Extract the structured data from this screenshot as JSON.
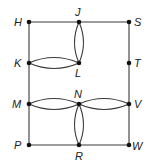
{
  "diagram": {
    "type": "graph",
    "vertices": [
      {
        "id": "H",
        "label": "H",
        "x": 29,
        "y": 22
      },
      {
        "id": "J",
        "label": "J",
        "x": 79,
        "y": 22
      },
      {
        "id": "S",
        "label": "S",
        "x": 129,
        "y": 22
      },
      {
        "id": "K",
        "label": "K",
        "x": 29,
        "y": 63
      },
      {
        "id": "L",
        "label": "L",
        "x": 79,
        "y": 63
      },
      {
        "id": "T",
        "label": "T",
        "x": 129,
        "y": 63
      },
      {
        "id": "M",
        "label": "M",
        "x": 29,
        "y": 104
      },
      {
        "id": "N",
        "label": "N",
        "x": 79,
        "y": 104
      },
      {
        "id": "V",
        "label": "V",
        "x": 129,
        "y": 104
      },
      {
        "id": "P",
        "label": "P",
        "x": 29,
        "y": 145
      },
      {
        "id": "R",
        "label": "R",
        "x": 79,
        "y": 145
      },
      {
        "id": "W",
        "label": "W",
        "x": 129,
        "y": 145
      }
    ],
    "edges": [
      {
        "from": "H",
        "to": "J",
        "kind": "straight"
      },
      {
        "from": "J",
        "to": "S",
        "kind": "straight"
      },
      {
        "from": "H",
        "to": "K",
        "kind": "straight"
      },
      {
        "from": "K",
        "to": "M",
        "kind": "straight"
      },
      {
        "from": "M",
        "to": "P",
        "kind": "straight"
      },
      {
        "from": "S",
        "to": "T",
        "kind": "straight"
      },
      {
        "from": "T",
        "to": "V",
        "kind": "straight"
      },
      {
        "from": "V",
        "to": "W",
        "kind": "straight"
      },
      {
        "from": "P",
        "to": "R",
        "kind": "straight"
      },
      {
        "from": "R",
        "to": "W",
        "kind": "straight"
      },
      {
        "from": "J",
        "to": "L",
        "kind": "double-arc"
      },
      {
        "from": "K",
        "to": "L",
        "kind": "double-arc"
      },
      {
        "from": "M",
        "to": "N",
        "kind": "double-arc"
      },
      {
        "from": "N",
        "to": "V",
        "kind": "double-arc"
      },
      {
        "from": "N",
        "to": "R",
        "kind": "double-arc"
      }
    ]
  },
  "labels": {
    "H": "H",
    "J": "J",
    "S": "S",
    "K": "K",
    "L": "L",
    "T": "T",
    "M": "M",
    "N": "N",
    "V": "V",
    "P": "P",
    "R": "R",
    "W": "W"
  }
}
